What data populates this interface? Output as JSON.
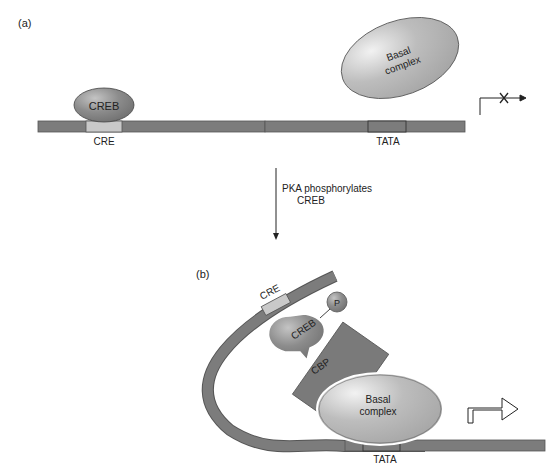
{
  "panel_a": {
    "label": "(a)",
    "creb": "CREB",
    "cre": "CRE",
    "basal_line1": "Basal",
    "basal_line2": "complex",
    "tata": "TATA",
    "transcription": "blocked"
  },
  "transition": {
    "line1": "PKA phosphorylates",
    "line2": "CREB"
  },
  "panel_b": {
    "label": "(b)",
    "cre": "CRE",
    "creb": "CREB",
    "phosphate": "P",
    "cbp": "CBP",
    "basal_line1": "Basal",
    "basal_line2": "complex",
    "tata": "TATA",
    "transcription": "active"
  },
  "colors": {
    "dna": "#7a7a7a",
    "cre_box": "#c8c8c8",
    "protein_dark": "#8a8a8a",
    "basal": "#b5b5b5"
  }
}
